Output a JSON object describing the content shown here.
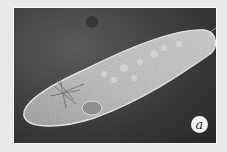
{
  "image": {
    "subject": "paramecium micrograph",
    "label": "a",
    "colors": {
      "background": "#e9e9e9",
      "photo_dark": "#2e2e2e",
      "organism_light": "#bdbdbd"
    }
  }
}
